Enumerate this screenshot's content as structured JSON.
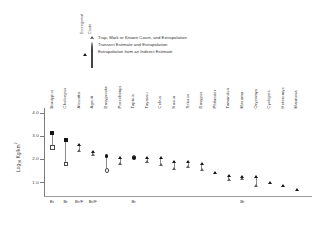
{
  "legend": {
    "column_headers": [
      "Ecoregional",
      "Crude"
    ],
    "rows": [
      {
        "label": "Trap, Mark or Known Count, and Extrapolation",
        "filled_marker": "triangle-filled",
        "open_marker": "triangle-open"
      },
      {
        "label": "Transect Estimate and Extrapolation",
        "filled_marker": "circle-filled",
        "open_marker": "circle-open"
      },
      {
        "label": "Extrapolation from an Indirect Estimate",
        "filled_marker": "square-filled",
        "open_marker": "square-open"
      }
    ]
  },
  "chart_data": {
    "type": "scatter",
    "title": "",
    "xlabel": "",
    "ylabel": "Log10 Kg/km2",
    "ylim": [
      0.4,
      4.2
    ],
    "yticks": [
      4.0,
      3.0,
      2.0,
      1.0
    ],
    "ytick_labels": [
      "4.0",
      "3.0",
      "2.0",
      "1.0"
    ],
    "grid": false,
    "legend_position": "top",
    "categories": [
      "Bradypus",
      "Choloepus",
      "Alouatta",
      "Ageuti",
      "Dasyprocta",
      "Proechimys",
      "Tapirus",
      "Tayassu",
      "Cebus",
      "Nasua",
      "Sciurus",
      "Dasypus",
      "Philander",
      "Tamandua",
      "Mazama",
      "Oryzomys",
      "Cyclopes",
      "Heteromys",
      "Marmosa"
    ],
    "xtick_groups": [
      {
        "label": "Br",
        "category": "Bradypus"
      },
      {
        "label": "Br",
        "category": "Choloepus"
      },
      {
        "label": "Br/F",
        "category": "Alouatta"
      },
      {
        "label": "Br/F",
        "category": "Ageuti"
      },
      {
        "label": "Br",
        "category": "Tapirus"
      },
      {
        "label": "Br",
        "category": "Mazama"
      }
    ],
    "series": [
      {
        "name": "Ecoregional",
        "marker_fill": "filled",
        "values": [
          3.12,
          2.82,
          2.62,
          2.3,
          2.14,
          2.05,
          2.05,
          2.06,
          2.06,
          1.88,
          1.85,
          1.77,
          1.4,
          1.26,
          1.22,
          1.2,
          0.98,
          0.85,
          0.68
        ]
      },
      {
        "name": "Crude",
        "marker_fill": "open",
        "values": [
          2.52,
          1.8,
          2.35,
          2.15,
          1.52,
          1.78,
          2.09,
          1.85,
          1.72,
          1.58,
          1.66,
          1.52,
          null,
          1.08,
          1.14,
          0.84,
          null,
          null,
          null
        ]
      }
    ],
    "marker_types": [
      "square",
      "square",
      "triangle",
      "triangle",
      "circle",
      "triangle",
      "circle",
      "triangle",
      "triangle",
      "triangle",
      "triangle",
      "triangle",
      "triangle",
      "triangle",
      "triangle",
      "triangle",
      "triangle",
      "triangle",
      "triangle"
    ]
  }
}
